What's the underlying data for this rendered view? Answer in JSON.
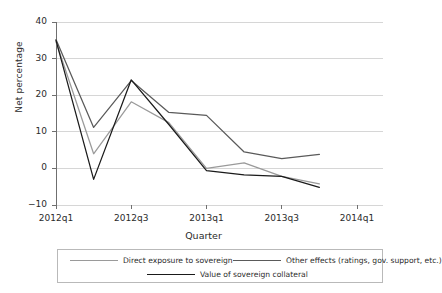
{
  "chart_data": {
    "type": "line",
    "title": "",
    "subtitle": "",
    "xlabel": "Quarter",
    "ylabel": "Net percentage",
    "x": [
      "2012q1",
      "2012q2",
      "2012q3",
      "2012q4",
      "2013q1",
      "2013q2",
      "2013q3",
      "2013q4"
    ],
    "x_tick_labels": [
      "2012q1",
      "2012q3",
      "2013q1",
      "2013q3",
      "2014q1"
    ],
    "x_tick_values": [
      "2012q1",
      "2012q3",
      "2013q1",
      "2013q3",
      "2014q1"
    ],
    "y_tick_labels": [
      "40",
      "30",
      "20",
      "10",
      "0",
      "−10"
    ],
    "y_tick_values": [
      40,
      30,
      20,
      10,
      0,
      -10
    ],
    "ylim": [
      -10,
      40
    ],
    "xlim": [
      "2012q1",
      "2014q1"
    ],
    "grid": "horizontal",
    "legend_position": "bottom",
    "series": [
      {
        "name": "Direct exposure to sovereign",
        "color": "#9a9a9a",
        "values": [
          34.6,
          4.0,
          18.2,
          12.5,
          0.0,
          1.5,
          -2.2,
          -4.2
        ]
      },
      {
        "name": "Other effects (ratings, gov. support, etc.)",
        "color": "#5a5a5a",
        "values": [
          35.2,
          11.2,
          24.0,
          15.3,
          14.5,
          4.5,
          2.7,
          3.8
        ]
      },
      {
        "name": "Value of sovereign collateral",
        "color": "#1a1a1a",
        "values": [
          35.0,
          -3.0,
          24.2,
          12.0,
          -0.6,
          -1.8,
          -2.2,
          -5.2
        ]
      }
    ]
  },
  "legend": {
    "entries": [
      {
        "label": "Direct exposure to sovereign"
      },
      {
        "label": "Other effects (ratings, gov. support, etc.)"
      },
      {
        "label": "Value of sovereign collateral"
      }
    ]
  },
  "colors": {
    "axis": "#6f6f6f",
    "grid": "#d6d6d6",
    "text": "#2b2b2b",
    "legend_border": "#b9b9b9",
    "background": "#ffffff"
  }
}
